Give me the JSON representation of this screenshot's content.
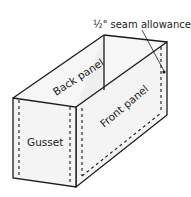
{
  "diagram": {
    "type": "box-construction",
    "labels": {
      "back_panel": "Back panel",
      "front_panel": "Front panel",
      "gusset": "Gusset",
      "seam_allowance": "½\" seam allowance"
    },
    "colors": {
      "stroke": "#1a1a1a",
      "face_fill": "#f4f4f4",
      "background": "#ffffff"
    }
  }
}
